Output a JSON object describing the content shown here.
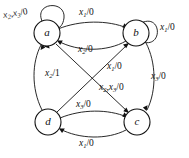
{
  "diagram": {
    "kind": "state-transition-diagram",
    "title": "",
    "stroke_color": "#111111",
    "background_color": "#ffffff",
    "states": [
      {
        "id": "a",
        "label": "a",
        "cx": 47,
        "cy": 33,
        "r": 13
      },
      {
        "id": "b",
        "label": "b",
        "cx": 136,
        "cy": 33,
        "r": 13
      },
      {
        "id": "d",
        "label": "d",
        "cx": 48,
        "cy": 122,
        "r": 13
      },
      {
        "id": "c",
        "label": "c",
        "cx": 137,
        "cy": 122,
        "r": 13
      }
    ],
    "transitions": [
      {
        "id": "a-self",
        "from": "a",
        "to": "a",
        "inputs": "x2,x3",
        "output": "0",
        "label": "x₂,x₃/0"
      },
      {
        "id": "b-self",
        "from": "b",
        "to": "b",
        "inputs": "x1",
        "output": "0",
        "label": "x₁/0"
      },
      {
        "id": "a-to-b",
        "from": "a",
        "to": "b",
        "inputs": "x1",
        "output": "0",
        "label": "x₁/0"
      },
      {
        "id": "b-to-a",
        "from": "b",
        "to": "a",
        "inputs": "x2",
        "output": "0",
        "label": "x₂/0"
      },
      {
        "id": "d-to-a",
        "from": "d",
        "to": "a",
        "inputs": "x2",
        "output": "1",
        "label": "x₂/1"
      },
      {
        "id": "d-to-b",
        "from": "d",
        "to": "b",
        "inputs": "x1",
        "output": "0",
        "label": "x₁/0"
      },
      {
        "id": "a-to-c",
        "from": "a",
        "to": "c",
        "inputs": "x2,x3",
        "output": "0",
        "label": "x₂,x₃/0"
      },
      {
        "id": "b-to-c",
        "from": "b",
        "to": "c",
        "inputs": "x3",
        "output": "0",
        "label": "x₃/0"
      },
      {
        "id": "d-to-c",
        "from": "d",
        "to": "c",
        "inputs": "x3",
        "output": "0",
        "label": "x₃/0"
      },
      {
        "id": "c-to-d",
        "from": "c",
        "to": "d",
        "inputs": "x1",
        "output": "0",
        "label": "x₁/0"
      }
    ],
    "labels": {
      "a_self": {
        "base": "x",
        "sub1": "2",
        "mid": ",x",
        "sub2": "3",
        "tail": "/0"
      },
      "b_self": {
        "base": "x",
        "sub1": "1",
        "tail": "/0"
      },
      "a_to_b": {
        "base": "x",
        "sub1": "1",
        "tail": "/0"
      },
      "b_to_a": {
        "base": "x",
        "sub1": "2",
        "tail": "/0"
      },
      "d_to_a": {
        "base": "x",
        "sub1": "2",
        "tail": "/1"
      },
      "d_to_b": {
        "base": "x",
        "sub1": "1",
        "tail": "/0"
      },
      "a_to_c": {
        "base": "x",
        "sub1": "2",
        "mid": ",x",
        "sub2": "3",
        "tail": "/0"
      },
      "b_to_c": {
        "base": "x",
        "sub1": "3",
        "tail": "/0"
      },
      "d_to_c": {
        "base": "x",
        "sub1": "3",
        "tail": "/0"
      },
      "c_to_d": {
        "base": "x",
        "sub1": "1",
        "tail": "/0"
      }
    },
    "state_names": {
      "a": "a",
      "b": "b",
      "c": "c",
      "d": "d"
    }
  }
}
